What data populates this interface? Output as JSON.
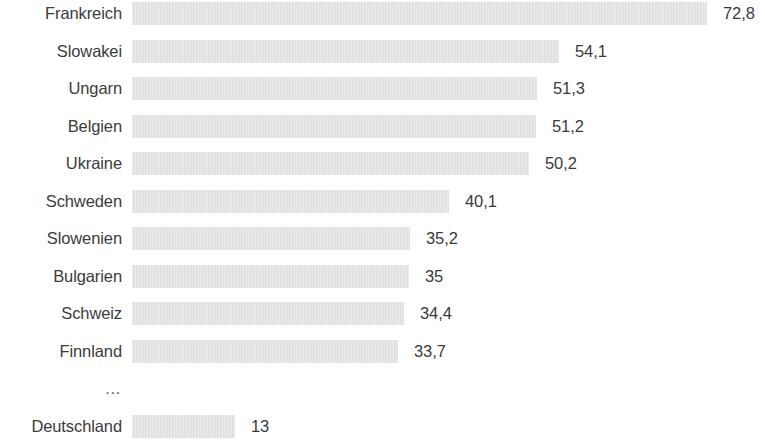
{
  "chart_data": {
    "type": "bar",
    "orientation": "horizontal",
    "title": "",
    "subtitle": "",
    "xlabel": "",
    "ylabel": "",
    "grid": false,
    "legend": null,
    "axis_visible": false,
    "xlim": [
      0,
      72.8
    ],
    "categories": [
      "Frankreich",
      "Slowakei",
      "Ungarn",
      "Belgien",
      "Ukraine",
      "Schweden",
      "Slowenien",
      "Bulgarien",
      "Schweiz",
      "Finnland",
      "…",
      "Deutschland"
    ],
    "values": [
      72.8,
      54.1,
      51.3,
      51.2,
      50.2,
      40.1,
      35.2,
      35,
      34.4,
      33.7,
      null,
      13
    ],
    "value_labels": [
      "72,8",
      "54,1",
      "51,3",
      "51,2",
      "50,2",
      "40,1",
      "35,2",
      "35",
      "34,4",
      "33,7",
      "",
      "13"
    ],
    "decimal_separator": ",",
    "bar_color": "#e3e3e3",
    "text_color": "#3b3b3b"
  },
  "rows": [
    {
      "label": "Frankreich",
      "value": 72.8,
      "value_label": "72,8",
      "has_bar": true
    },
    {
      "label": "Slowakei",
      "value": 54.1,
      "value_label": "54,1",
      "has_bar": true
    },
    {
      "label": "Ungarn",
      "value": 51.3,
      "value_label": "51,3",
      "has_bar": true
    },
    {
      "label": "Belgien",
      "value": 51.2,
      "value_label": "51,2",
      "has_bar": true
    },
    {
      "label": "Ukraine",
      "value": 50.2,
      "value_label": "50,2",
      "has_bar": true
    },
    {
      "label": "Schweden",
      "value": 40.1,
      "value_label": "40,1",
      "has_bar": true
    },
    {
      "label": "Slowenien",
      "value": 35.2,
      "value_label": "35,2",
      "has_bar": true
    },
    {
      "label": "Bulgarien",
      "value": 35,
      "value_label": "35",
      "has_bar": true
    },
    {
      "label": "Schweiz",
      "value": 34.4,
      "value_label": "34,4",
      "has_bar": true
    },
    {
      "label": "Finnland",
      "value": 33.7,
      "value_label": "33,7",
      "has_bar": true
    },
    {
      "label": "…",
      "value": null,
      "value_label": "",
      "has_bar": false
    },
    {
      "label": "Deutschland",
      "value": 13,
      "value_label": "13",
      "has_bar": true
    }
  ],
  "layout": {
    "bar_origin_x": 132,
    "px_per_unit": 7.9,
    "bar_height": 23,
    "row_pitch": 37.5,
    "first_row_top": 2,
    "label_right_edge": 122,
    "value_gap": 16
  }
}
